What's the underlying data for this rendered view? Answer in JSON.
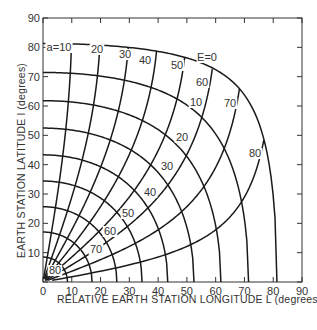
{
  "chart_data": {
    "type": "line",
    "title": "",
    "xlabel": "RELATIVE EARTH STATION LONGITUDE L (degrees)",
    "ylabel": "EARTH STATION LATITUDE l (degrees)",
    "xlim": [
      0,
      90
    ],
    "ylim": [
      0,
      90
    ],
    "x_ticks": [
      0,
      10,
      20,
      30,
      40,
      50,
      60,
      70,
      80,
      90
    ],
    "y_ticks": [
      0,
      10,
      20,
      30,
      40,
      50,
      60,
      70,
      80,
      90
    ],
    "grid": false,
    "legend": null,
    "orbit_ratio_re_over_r": 0.1513,
    "series_groups": [
      {
        "name": "Elevation angle E (degrees) — constant-elevation contours",
        "parameter": "E",
        "values": [
          0,
          10,
          20,
          30,
          40,
          50,
          60,
          70,
          80
        ],
        "labels": [
          "E=0",
          "10",
          "20",
          "30",
          "40",
          "50",
          "60",
          "70",
          "80"
        ],
        "approx_central_angle_deg": [
          81.3,
          71.4,
          62.1,
          53.3,
          44.9,
          36.8,
          28.9,
          21.2,
          13.6
        ]
      },
      {
        "name": "Azimuth angle a (degrees) — constant-azimuth lines",
        "parameter": "a",
        "values": [
          10,
          20,
          30,
          40,
          50,
          60,
          70,
          80
        ],
        "labels": [
          "a=10",
          "20",
          "30",
          "40",
          "50",
          "60",
          "70",
          "80"
        ]
      }
    ],
    "annotations": [
      {
        "text": "a=10",
        "x_px": 59,
        "y_px": 51
      },
      {
        "text": "20",
        "x_px": 97,
        "y_px": 53
      },
      {
        "text": "30",
        "x_px": 125,
        "y_px": 58
      },
      {
        "text": "40",
        "x_px": 145,
        "y_px": 64
      },
      {
        "text": "50",
        "x_px": 177,
        "y_px": 69
      },
      {
        "text": "60",
        "x_px": 202,
        "y_px": 86
      },
      {
        "text": "70",
        "x_px": 230,
        "y_px": 107
      },
      {
        "text": "80",
        "x_px": 255,
        "y_px": 157
      },
      {
        "text": "E=0",
        "x_px": 207,
        "y_px": 61
      },
      {
        "text": "10",
        "x_px": 196,
        "y_px": 106
      },
      {
        "text": "20",
        "x_px": 182,
        "y_px": 141
      },
      {
        "text": "30",
        "x_px": 167,
        "y_px": 170
      },
      {
        "text": "40",
        "x_px": 150,
        "y_px": 196
      },
      {
        "text": "50",
        "x_px": 128,
        "y_px": 217
      },
      {
        "text": "60",
        "x_px": 110,
        "y_px": 235
      },
      {
        "text": "70",
        "x_px": 96,
        "y_px": 253
      },
      {
        "text": "80",
        "x_px": 55,
        "y_px": 274
      }
    ]
  },
  "plot_area_px": {
    "left": 43,
    "right": 302,
    "top": 18,
    "bottom": 282
  },
  "style": {
    "line_color": "#1a1a1a",
    "text_color": "#333333",
    "background": "#ffffff"
  }
}
